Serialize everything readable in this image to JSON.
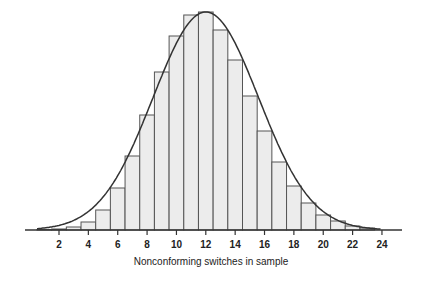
{
  "chart_data": {
    "type": "bar",
    "title": "",
    "xlabel": "Nonconforming switches in sample",
    "ylabel": "",
    "categories": [
      1,
      2,
      3,
      4,
      5,
      6,
      7,
      8,
      9,
      10,
      11,
      12,
      13,
      14,
      15,
      16,
      17,
      18,
      19,
      20,
      21,
      22,
      23
    ],
    "values": [
      0.5,
      1,
      3,
      8,
      20,
      42,
      74,
      115,
      158,
      194,
      215,
      218,
      200,
      170,
      134,
      99,
      68,
      44,
      27,
      15,
      9,
      4,
      2
    ],
    "overlay": "normal curve, mean 12",
    "xticks": [
      2,
      4,
      6,
      8,
      10,
      12,
      14,
      16,
      18,
      20,
      22,
      24
    ],
    "xlim": [
      0,
      25.5
    ],
    "grid": false,
    "bar_fill": "#ececec",
    "bar_stroke": "#555555",
    "curve_color": "#333333"
  }
}
